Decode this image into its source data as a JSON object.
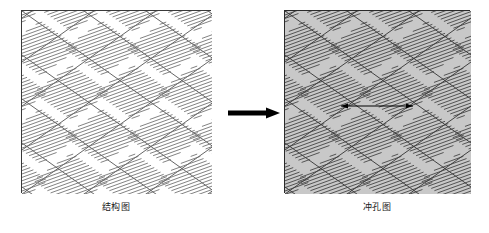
{
  "figure": {
    "type": "technical-diagram",
    "background_color": "#ffffff",
    "width": 489,
    "height": 233,
    "panels": [
      {
        "id": "structure-panel",
        "caption": "结构图",
        "fill_color": "#ffffff",
        "border_color": "#3a3a3a",
        "lattice_line_color": "#555555",
        "hatch_line_color": "#6b6b6b",
        "x": 21,
        "y": 10,
        "w": 190,
        "h": 183,
        "has_dimension_arrow": false
      },
      {
        "id": "punching-panel",
        "caption": "冲孔图",
        "fill_color": "#c8c8c8",
        "border_color": "#2a2a2a",
        "lattice_line_color": "#333333",
        "hatch_line_color": "#3d3d3d",
        "x": 284,
        "y": 10,
        "w": 186,
        "h": 183,
        "has_dimension_arrow": true
      }
    ],
    "transition_arrow": {
      "name": "process-arrow",
      "direction": "right",
      "color": "#000000",
      "x": 228,
      "y": 113,
      "length": 52,
      "shaft_thickness": 5
    },
    "dimension_arrow": {
      "name": "pitch-dimension-arrow",
      "direction": "double-headed",
      "color": "#000000",
      "x1": 340,
      "x2": 412,
      "y": 105
    },
    "lattice": {
      "description": "diamond grid of two crossing line families with hatched parallelogram cells",
      "slope_down_deg": -35,
      "slope_up_deg": 35,
      "cell_step_x": 62,
      "cell_step_y": 44,
      "hatch_angle_deg": 20,
      "hatch_spacing_px": 3.2
    }
  }
}
